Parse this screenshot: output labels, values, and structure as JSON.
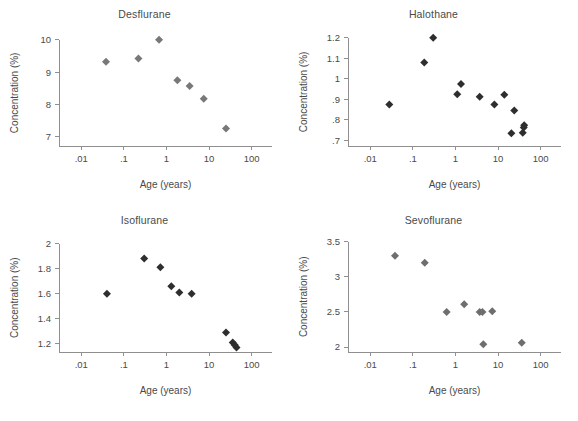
{
  "figure": {
    "panel_count": 4,
    "marker_shape": "diamond",
    "axis_color": "#8f8f8f",
    "text_color": "#4a4a4a",
    "background": "#ffffff"
  },
  "chart_data": [
    {
      "type": "scatter",
      "title": "Desflurane",
      "xlabel": "Age (years)",
      "ylabel": "Concentration (%)",
      "xscale": "log",
      "xlim": [
        0.003,
        300
      ],
      "ylim": [
        6.72,
        10.3
      ],
      "xticks": [
        0.01,
        0.1,
        1,
        10,
        100
      ],
      "xticklabels": [
        ".01",
        ".1",
        "1",
        "10",
        "100"
      ],
      "yticks": [
        7,
        8,
        9,
        10
      ],
      "yticklabels": [
        "7",
        "8",
        "9",
        "10"
      ],
      "grid": false,
      "legend": "none",
      "marker_color": "#787878",
      "points": [
        {
          "x": 0.038,
          "y": 9.32
        },
        {
          "x": 0.22,
          "y": 9.42
        },
        {
          "x": 0.67,
          "y": 10.0
        },
        {
          "x": 1.8,
          "y": 8.75
        },
        {
          "x": 3.5,
          "y": 8.57
        },
        {
          "x": 7.5,
          "y": 8.18
        },
        {
          "x": 25.0,
          "y": 7.26
        }
      ]
    },
    {
      "type": "scatter",
      "title": "Halothane",
      "xlabel": "Age (years)",
      "ylabel": "Concentration (%)",
      "xscale": "log",
      "xlim": [
        0.003,
        300
      ],
      "ylim": [
        0.672,
        1.238
      ],
      "xticks": [
        0.01,
        0.1,
        1,
        10,
        100
      ],
      "xticklabels": [
        ".01",
        ".1",
        "1",
        "10",
        "100"
      ],
      "yticks": [
        0.7,
        0.8,
        0.9,
        1,
        1.1,
        1.2
      ],
      "yticklabels": [
        ".7",
        ".8",
        ".9",
        "1",
        "1.1",
        "1.2"
      ],
      "grid": false,
      "legend": "none",
      "marker_color": "#2e2e2e",
      "points": [
        {
          "x": 0.028,
          "y": 0.875
        },
        {
          "x": 0.185,
          "y": 1.08
        },
        {
          "x": 0.3,
          "y": 1.2
        },
        {
          "x": 1.1,
          "y": 0.925
        },
        {
          "x": 1.35,
          "y": 0.975
        },
        {
          "x": 3.7,
          "y": 0.912
        },
        {
          "x": 8.2,
          "y": 0.875
        },
        {
          "x": 14.0,
          "y": 0.922
        },
        {
          "x": 20.5,
          "y": 0.734
        },
        {
          "x": 24.0,
          "y": 0.845
        },
        {
          "x": 38.0,
          "y": 0.737
        },
        {
          "x": 40.0,
          "y": 0.762
        },
        {
          "x": 41.0,
          "y": 0.773
        }
      ]
    },
    {
      "type": "scatter",
      "title": "Isoflurane",
      "xlabel": "Age (years)",
      "ylabel": "Concentration (%)",
      "xscale": "log",
      "xlim": [
        0.003,
        300
      ],
      "ylim": [
        1.135,
        2.06
      ],
      "xticks": [
        0.01,
        0.1,
        1,
        10,
        100
      ],
      "xticklabels": [
        ".01",
        ".1",
        "1",
        "10",
        "100"
      ],
      "yticks": [
        1.2,
        1.4,
        1.6,
        1.8,
        2
      ],
      "yticklabels": [
        "1.2",
        "1.4",
        "1.6",
        "1.8",
        "2"
      ],
      "grid": false,
      "legend": "none",
      "marker_color": "#2e2e2e",
      "points": [
        {
          "x": 0.04,
          "y": 1.6
        },
        {
          "x": 0.3,
          "y": 1.88
        },
        {
          "x": 0.72,
          "y": 1.81
        },
        {
          "x": 1.3,
          "y": 1.66
        },
        {
          "x": 2.0,
          "y": 1.61
        },
        {
          "x": 3.9,
          "y": 1.6
        },
        {
          "x": 25.0,
          "y": 1.29
        },
        {
          "x": 36.0,
          "y": 1.21
        },
        {
          "x": 40.0,
          "y": 1.19
        },
        {
          "x": 44.0,
          "y": 1.17
        }
      ]
    },
    {
      "type": "scatter",
      "title": "Sevoflurane",
      "xlabel": "Age (years)",
      "ylabel": "Concentration (%)",
      "xscale": "log",
      "xlim": [
        0.003,
        300
      ],
      "ylim": [
        1.93,
        3.58
      ],
      "xticks": [
        0.01,
        0.1,
        1,
        10,
        100
      ],
      "xticklabels": [
        ".01",
        ".1",
        "1",
        "10",
        "100"
      ],
      "yticks": [
        2,
        2.5,
        3,
        3.5
      ],
      "yticklabels": [
        "2",
        "2.5",
        "3",
        "3.5"
      ],
      "grid": false,
      "legend": "none",
      "marker_color": "#6e6e6e",
      "points": [
        {
          "x": 0.038,
          "y": 3.3
        },
        {
          "x": 0.19,
          "y": 3.2
        },
        {
          "x": 0.62,
          "y": 2.5
        },
        {
          "x": 1.6,
          "y": 2.61
        },
        {
          "x": 3.7,
          "y": 2.5
        },
        {
          "x": 4.3,
          "y": 2.5
        },
        {
          "x": 4.5,
          "y": 2.04
        },
        {
          "x": 7.3,
          "y": 2.51
        },
        {
          "x": 36.0,
          "y": 2.06
        }
      ]
    }
  ]
}
